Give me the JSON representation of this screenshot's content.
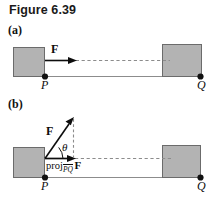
{
  "figure": {
    "title": "Figure 6.39",
    "panels": [
      {
        "id": "a",
        "label": "(a)",
        "force_label": "F",
        "point_start_label": "P",
        "point_end_label": "Q",
        "description": "Force F applied horizontally along PQ"
      },
      {
        "id": "b",
        "label": "(b)",
        "force_label": "F",
        "angle_label": "θ",
        "projection_word": "proj",
        "projection_subscript": "PQ",
        "projection_vector": "F",
        "point_start_label": "P",
        "point_end_label": "Q",
        "description": "Force F at angle theta above PQ with projection onto PQ"
      }
    ]
  },
  "colors": {
    "box_fill": "#b3b3b3",
    "box_stroke": "#5a5a5a",
    "line": "#8c8c8c",
    "ink": "#0d0d0d",
    "dash": "#8c8c8c",
    "background": "#ffffff"
  }
}
